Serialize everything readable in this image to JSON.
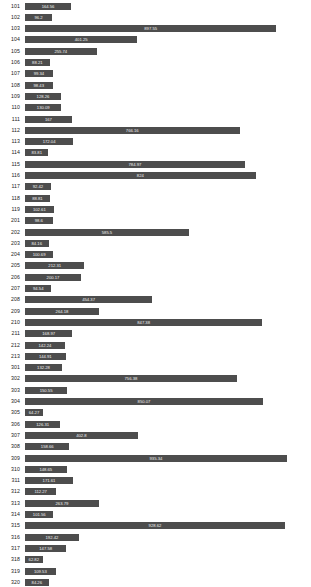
{
  "chart_data": {
    "type": "bar",
    "orientation": "horizontal",
    "title": "",
    "subtitle": "",
    "xlabel": "",
    "ylabel": "",
    "grid": false,
    "legend": false,
    "axis_visible": false,
    "bar_color": "#4d4d4d",
    "value_label_color": "#f2f2f2",
    "background": "#ffffff",
    "xlim": [
      0,
      1000
    ],
    "categories": [
      "101",
      "102",
      "103",
      "104",
      "105",
      "106",
      "107",
      "108",
      "109",
      "110",
      "111",
      "112",
      "113",
      "114",
      "115",
      "116",
      "117",
      "118",
      "119",
      "201",
      "202",
      "203",
      "204",
      "205",
      "206",
      "207",
      "208",
      "209",
      "210",
      "211",
      "212",
      "213",
      "301",
      "302",
      "303",
      "304",
      "305",
      "306",
      "307",
      "308",
      "309",
      "310",
      "311",
      "312",
      "313",
      "314",
      "315",
      "316",
      "317",
      "318",
      "319",
      "320"
    ],
    "values": [
      164.56,
      96.2,
      897.55,
      401.25,
      255.74,
      88.21,
      99.34,
      98.43,
      128.26,
      130.09,
      167.0,
      766.16,
      172.04,
      83.81,
      784.97,
      824.0,
      92.42,
      88.81,
      102.61,
      98.6,
      585.5,
      84.16,
      100.69,
      212.31,
      200.17,
      94.54,
      454.37,
      264.18,
      847.38,
      168.97,
      142.24,
      144.91,
      132.28,
      756.38,
      150.55,
      850.07,
      64.27,
      126.31,
      402.8,
      158.66,
      935.34,
      148.65,
      171.61,
      112.27,
      263.79,
      101.56,
      928.62,
      192.42,
      147.58,
      62.82,
      109.53,
      84.26
    ],
    "value_labels": [
      "164.56",
      "96.2",
      "897.55",
      "401.25",
      "255.74",
      "88.21",
      "99.34",
      "98.43",
      "128.26",
      "130.09",
      "167",
      "766.16",
      "172.04",
      "83.81",
      "784.97",
      "824",
      "92.42",
      "88.81",
      "102.61",
      "98.6",
      "585.5",
      "84.16",
      "100.69",
      "212.31",
      "200.17",
      "94.54",
      "454.37",
      "264.18",
      "847.38",
      "168.97",
      "142.24",
      "144.91",
      "132.28",
      "756.38",
      "150.55",
      "850.07",
      "64.27",
      "126.31",
      "402.8",
      "158.66",
      "935.34",
      "148.65",
      "171.61",
      "112.27",
      "263.79",
      "101.56",
      "928.62",
      "192.42",
      "147.58",
      "62.82",
      "109.53",
      "84.26"
    ]
  }
}
